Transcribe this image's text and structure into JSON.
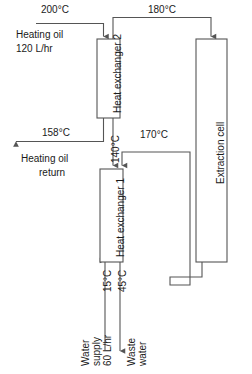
{
  "diagram": {
    "line_color": "#555555",
    "text_color": "#1a1a1a",
    "background": "#ffffff",
    "units": {
      "temperature": "°C",
      "flow": "L/hr"
    },
    "equipment": [
      {
        "id": "heat-exchanger-2",
        "label": "Heat exchanger 2"
      },
      {
        "id": "heat-exchanger-1",
        "label": "Heat exchanger 1"
      },
      {
        "id": "extraction-cell",
        "label": "Extraction cell"
      }
    ],
    "streams": {
      "oil_inlet": {
        "temperature": "200°C",
        "name": "Heating oil",
        "rate": "120 L/hr"
      },
      "oil_to_cell": {
        "temperature": "180°C"
      },
      "oil_return": {
        "temperature": "158°C",
        "name_line1": "Heating oil",
        "name_line2": "return"
      },
      "cell_return": {
        "temperature": "170°C"
      },
      "hx1_inlet": {
        "temperature": "140°C"
      },
      "water_supply": {
        "temperature": "15°C",
        "name_line1": "Water",
        "name_line2": "supply",
        "rate": "60 L/hr"
      },
      "waste_water": {
        "temperature": "45°C",
        "name_line1": "Waste",
        "name_line2": "water"
      }
    }
  }
}
